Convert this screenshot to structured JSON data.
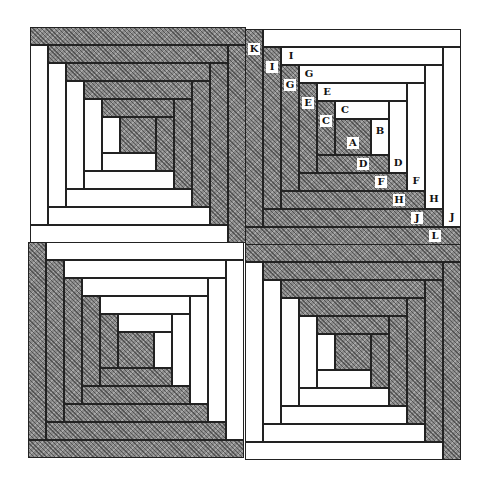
{
  "diagram": {
    "colors": {
      "light": "#ffffff",
      "dark": "#8a8a8a",
      "outline": "#222222"
    },
    "center_label": "A",
    "strip_sequence": [
      {
        "label": "B",
        "side": "right",
        "fabric": "light"
      },
      {
        "label": "C",
        "side": "top",
        "fabric": "light"
      },
      {
        "label": "C",
        "side": "left",
        "fabric": "dark"
      },
      {
        "label": "D",
        "side": "bottom",
        "fabric": "dark"
      },
      {
        "label": "D",
        "side": "right",
        "fabric": "light"
      },
      {
        "label": "E",
        "side": "top",
        "fabric": "light"
      },
      {
        "label": "E",
        "side": "left",
        "fabric": "dark"
      },
      {
        "label": "F",
        "side": "bottom",
        "fabric": "dark"
      },
      {
        "label": "F",
        "side": "right",
        "fabric": "light"
      },
      {
        "label": "G",
        "side": "top",
        "fabric": "light"
      },
      {
        "label": "G",
        "side": "left",
        "fabric": "dark"
      },
      {
        "label": "H",
        "side": "bottom",
        "fabric": "dark"
      },
      {
        "label": "H",
        "side": "right",
        "fabric": "light"
      },
      {
        "label": "I",
        "side": "top",
        "fabric": "light"
      },
      {
        "label": "I",
        "side": "left",
        "fabric": "dark"
      },
      {
        "label": "J",
        "side": "bottom",
        "fabric": "dark"
      },
      {
        "label": "J",
        "side": "right",
        "fabric": "light"
      },
      {
        "label": "",
        "side": "top",
        "fabric": "light"
      },
      {
        "label": "K",
        "side": "left",
        "fabric": "dark"
      },
      {
        "label": "L",
        "side": "bottom",
        "fabric": "dark"
      }
    ],
    "blocks": [
      {
        "name": "block-top-left",
        "x": 30,
        "y": 27,
        "rotate180": true,
        "labeled": false
      },
      {
        "name": "block-top-right",
        "x": 245,
        "y": 29,
        "rotate180": false,
        "labeled": true
      },
      {
        "name": "block-bottom-left",
        "x": 28,
        "y": 242,
        "rotate180": false,
        "labeled": false
      },
      {
        "name": "block-bottom-right",
        "x": 245,
        "y": 244,
        "rotate180": true,
        "labeled": false
      }
    ],
    "center_size": 36,
    "strip_width": 18
  }
}
